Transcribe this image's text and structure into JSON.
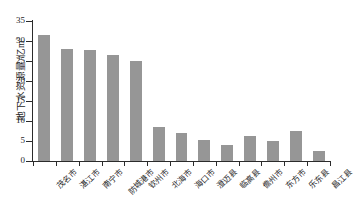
{
  "chart_data": {
    "type": "bar",
    "title": "",
    "subtitle": "",
    "xlabel": "",
    "ylabel": "地下水资源量/亿m³",
    "ylabel_text": "地下水资源量/亿m",
    "ylabel_sup": "3",
    "ylim": [
      0,
      35
    ],
    "yticks": [
      0,
      5,
      10,
      15,
      20,
      25,
      30,
      35
    ],
    "ytick_labels": [
      "0",
      "5",
      "10",
      "15",
      "20",
      "25",
      "30",
      "35"
    ],
    "grid": false,
    "legend": null,
    "bar_color": "#969696",
    "axis_color": "#2b2b2b",
    "categories": [
      "茂名市",
      "湛江市",
      "南宁市",
      "防城港市",
      "钦州市",
      "北海市",
      "海口市",
      "澄迈县",
      "临高县",
      "儋州市",
      "东方市",
      "乐东县",
      "昌江县"
    ],
    "values": [
      31.5,
      28.0,
      27.7,
      26.4,
      24.9,
      8.5,
      7.0,
      5.2,
      4.0,
      6.3,
      5.0,
      7.4,
      2.6
    ]
  }
}
